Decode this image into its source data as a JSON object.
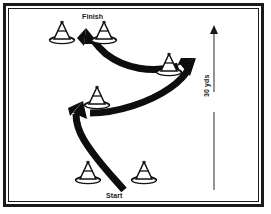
{
  "diagram": {
    "frame": {
      "outer_color": "#1a1a1a",
      "inner_color": "#1a1a1a",
      "background": "#ffffff"
    },
    "labels": {
      "finish": "Finish",
      "start": "Start",
      "distance": "30 yds"
    },
    "path": {
      "color": "#0d0d0d",
      "description": "serpentine weaving arrow from start to finish",
      "direction": "bottom-to-top"
    },
    "measurement": {
      "value": "30 yds",
      "line_color": "#4d4d4d",
      "arrow_direction": "up"
    },
    "cones": [
      {
        "name": "cone-finish-left",
        "x": 62,
        "y": 32
      },
      {
        "name": "cone-finish-right",
        "x": 104,
        "y": 32
      },
      {
        "name": "cone-mid-upper",
        "x": 169,
        "y": 64
      },
      {
        "name": "cone-mid-lower",
        "x": 97,
        "y": 97
      },
      {
        "name": "cone-start-left",
        "x": 88,
        "y": 172
      },
      {
        "name": "cone-start-right",
        "x": 144,
        "y": 172
      }
    ],
    "cone_color": "#111111",
    "cone_fill": "#ffffff"
  }
}
